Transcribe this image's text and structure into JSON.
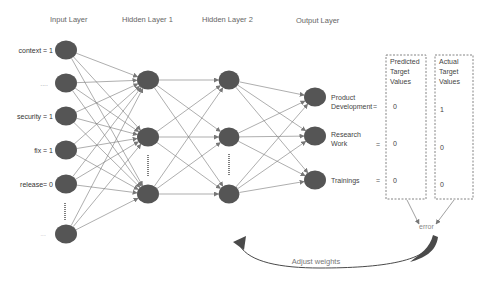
{
  "layer_titles": {
    "input": "Input Layer",
    "hidden1": "Hidden Layer 1",
    "hidden2": "Hidden Layer 2",
    "output": "Output Layer"
  },
  "input_labels": [
    "context = 1",
    "....",
    "security = 1",
    "fix = 1",
    "release= 0",
    "...."
  ],
  "outputs": [
    {
      "label_lines": [
        "Product",
        "Development"
      ],
      "eq": "=",
      "predicted": "0",
      "actual": "1"
    },
    {
      "label_lines": [
        "Research",
        "Work"
      ],
      "eq": "=",
      "predicted": "0",
      "actual": "0"
    },
    {
      "label_lines": [
        "Trainings"
      ],
      "eq": "=",
      "predicted": "0",
      "actual": "0"
    }
  ],
  "predicted_box_title": [
    "Predicted",
    "Target",
    "Values"
  ],
  "actual_box_title": [
    "Actual",
    "Target",
    "Values"
  ],
  "error_label": "error",
  "adjust_label": "Adjust weights",
  "colors": {
    "node": "#555555",
    "edge": "#777777",
    "box_border": "#666666",
    "feedback_arrow": "#4a4a4a"
  }
}
